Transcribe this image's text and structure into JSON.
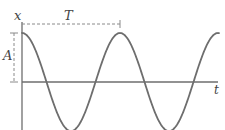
{
  "diagram": {
    "type": "sinusoid (cosine) displacement-time graph",
    "labels": {
      "vertical_axis": "x",
      "horizontal_axis": "t",
      "period": "T",
      "amplitude": "A"
    },
    "colors": {
      "curve": "#6e6e6e",
      "axes": "#6e6e6e",
      "dashed": "#8a8a8a",
      "text": "#444444",
      "background": "#ffffff"
    },
    "geometry": {
      "origin_x": 22,
      "axis_y": 82,
      "amplitude_px": 49,
      "period_px": 98,
      "curve_start_x": 22,
      "curve_end_x": 219,
      "y_axis_top": 22,
      "y_axis_bottom": 130,
      "t_axis_end": 218,
      "period_marker_y": 24,
      "period_marker_x_start": 22,
      "period_marker_x_end": 120,
      "amplitude_marker_x": 14
    },
    "curve": {
      "function": "x = A cos(2πt/T)",
      "visible_periods": 2.0
    }
  }
}
